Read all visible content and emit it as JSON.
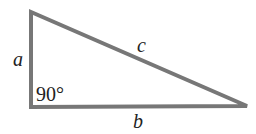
{
  "diagram": {
    "type": "right-triangle",
    "stroke_color": "#777777",
    "text_color": "#222222",
    "vertices": {
      "top": [
        31,
        12
      ],
      "right_angle": [
        31,
        107
      ],
      "right": [
        247,
        106
      ]
    },
    "labels": {
      "side_a": "a",
      "side_b": "b",
      "side_c": "c",
      "angle": "90°"
    }
  }
}
